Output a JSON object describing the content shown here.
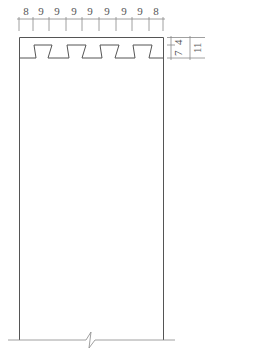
{
  "drawing": {
    "type": "cross-section",
    "top_dimensions": [
      "8",
      "9",
      "9",
      "9",
      "9",
      "9",
      "9",
      "9",
      "8"
    ],
    "side_dimensions": {
      "inner_upper": "7",
      "inner_lower": "4",
      "outer_total": "11"
    },
    "colors": {
      "line": "#555555",
      "dim_line": "#888888"
    }
  }
}
